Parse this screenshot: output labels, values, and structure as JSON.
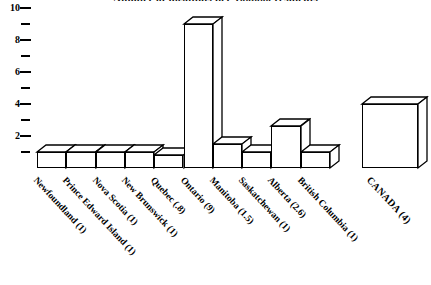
{
  "chart": {
    "title": "Number of hospitals per 100,000 residents",
    "title_visible_note": "cut off at top edge"
  },
  "chart_data": {
    "type": "bar",
    "title": "Number of hospitals per 100,000 residents",
    "xlabel": "",
    "ylabel": "",
    "ylim": [
      0,
      10
    ],
    "grid": false,
    "legend": null,
    "style": "3d-line-art-boxes",
    "categories": [
      "Newfoundland (1)",
      "Prince Edward Island (1)",
      "Nova Scotia (1)",
      "New Brunswick (1)",
      "Quebec (.8)",
      "Ontario (9)",
      "Manitoba (1.5)",
      "Saskatchewan (1)",
      "Alberta (2.6)",
      "British Columbia (1)",
      "CANADA (4)"
    ],
    "values": [
      1,
      1,
      1,
      1,
      0.8,
      9,
      1.5,
      1,
      2.6,
      1,
      4
    ],
    "y_major_ticks": [
      2,
      4,
      6,
      8,
      10
    ],
    "y_minor_ticks": [
      1,
      3,
      5,
      7,
      9
    ],
    "y_tick_labels": [
      "2",
      "4",
      "6",
      "8",
      "10"
    ]
  },
  "axis": {
    "y_labels": [
      {
        "value": 10,
        "text": "10"
      },
      {
        "value": 8,
        "text": "8"
      },
      {
        "value": 6,
        "text": "6"
      },
      {
        "value": 4,
        "text": "4"
      },
      {
        "value": 2,
        "text": "2"
      }
    ]
  },
  "bars": [
    {
      "name": "newfoundland",
      "label": "Newfoundland (1)",
      "value": 1
    },
    {
      "name": "prince-edward-island",
      "label": "Prince Edward Island (1)",
      "value": 1
    },
    {
      "name": "nova-scotia",
      "label": "Nova Scotia (1)",
      "value": 1
    },
    {
      "name": "new-brunswick",
      "label": "New Brunswick (1)",
      "value": 1
    },
    {
      "name": "quebec",
      "label": "Quebec (.8)",
      "value": 0.8
    },
    {
      "name": "ontario",
      "label": "Ontario (9)",
      "value": 9
    },
    {
      "name": "manitoba",
      "label": "Manitoba (1.5)",
      "value": 1.5
    },
    {
      "name": "saskatchewan",
      "label": "Saskatchewan (1)",
      "value": 1
    },
    {
      "name": "alberta",
      "label": "Alberta (2.6)",
      "value": 2.6
    },
    {
      "name": "british-columbia",
      "label": "British Columbia (1)",
      "value": 1
    },
    {
      "name": "canada",
      "label": "CANADA (4)",
      "value": 4
    }
  ]
}
